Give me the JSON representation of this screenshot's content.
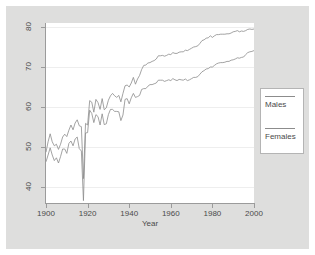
{
  "chart_data": {
    "type": "line",
    "title": "",
    "xlabel": "Year",
    "ylabel": "",
    "xlim": [
      1900,
      2000
    ],
    "ylim": [
      36,
      81
    ],
    "grid": true,
    "grid_orientation": "horizontal",
    "legend_position": "right-outside",
    "x_ticks": [
      1900,
      1920,
      1940,
      1960,
      1980,
      2000
    ],
    "y_ticks": [
      40,
      50,
      60,
      70,
      80
    ],
    "x_tick_labels": [
      "1900",
      "1920",
      "1940",
      "1960",
      "1980",
      "2000"
    ],
    "y_tick_labels": [
      "40",
      "50",
      "60",
      "70",
      "80"
    ],
    "annotations": [],
    "x": [
      1900,
      1901,
      1902,
      1903,
      1904,
      1905,
      1906,
      1907,
      1908,
      1909,
      1910,
      1911,
      1912,
      1913,
      1914,
      1915,
      1916,
      1917,
      1918,
      1919,
      1920,
      1921,
      1922,
      1923,
      1924,
      1925,
      1926,
      1927,
      1928,
      1929,
      1930,
      1931,
      1932,
      1933,
      1934,
      1935,
      1936,
      1937,
      1938,
      1939,
      1940,
      1941,
      1942,
      1943,
      1944,
      1945,
      1946,
      1947,
      1948,
      1949,
      1950,
      1951,
      1952,
      1953,
      1954,
      1955,
      1956,
      1957,
      1958,
      1959,
      1960,
      1961,
      1962,
      1963,
      1964,
      1965,
      1966,
      1967,
      1968,
      1969,
      1970,
      1971,
      1972,
      1973,
      1974,
      1975,
      1976,
      1977,
      1978,
      1979,
      1980,
      1981,
      1982,
      1983,
      1984,
      1985,
      1986,
      1987,
      1988,
      1989,
      1990,
      1991,
      1992,
      1993,
      1994,
      1995,
      1996,
      1997,
      1998,
      1999,
      2000
    ],
    "series": [
      {
        "name": "Females",
        "values": [
          48.7,
          51.3,
          53.3,
          51.3,
          50.3,
          50.7,
          49.4,
          50.7,
          52.5,
          53.2,
          52.6,
          54.2,
          55.5,
          54.3,
          56.0,
          56.8,
          55.3,
          55.1,
          42.1,
          55.9,
          55.5,
          61.6,
          61.2,
          58.7,
          61.9,
          61.1,
          59.4,
          62.1,
          59.3,
          59.8,
          61.7,
          62.8,
          63.4,
          62.8,
          62.4,
          62.9,
          61.3,
          63.4,
          65.3,
          65.5,
          65.0,
          66.0,
          67.4,
          65.7,
          67.0,
          67.9,
          69.4,
          70.4,
          70.5,
          71.0,
          71.1,
          71.4,
          71.6,
          72.0,
          72.8,
          72.8,
          72.9,
          72.7,
          72.9,
          73.2,
          73.1,
          73.6,
          73.4,
          73.4,
          73.7,
          73.8,
          73.8,
          74.2,
          74.1,
          74.4,
          74.7,
          75.0,
          75.1,
          75.3,
          75.9,
          76.6,
          76.8,
          77.2,
          77.3,
          77.8,
          77.4,
          77.8,
          78.1,
          78.1,
          78.2,
          78.2,
          78.2,
          78.3,
          78.3,
          78.5,
          78.8,
          78.9,
          79.1,
          78.8,
          79.0,
          78.9,
          79.1,
          79.4,
          79.5,
          79.4,
          79.5
        ]
      },
      {
        "name": "Males",
        "values": [
          46.3,
          48.0,
          49.8,
          48.0,
          46.6,
          47.3,
          46.0,
          47.6,
          49.5,
          49.5,
          48.4,
          50.9,
          51.5,
          50.3,
          52.0,
          52.5,
          49.6,
          49.0,
          36.6,
          53.5,
          53.6,
          59.2,
          58.4,
          56.1,
          58.1,
          57.6,
          55.5,
          58.3,
          55.6,
          55.8,
          58.1,
          59.4,
          59.4,
          58.9,
          58.9,
          58.8,
          56.6,
          58.0,
          61.9,
          62.1,
          60.8,
          62.3,
          63.4,
          62.4,
          62.6,
          62.9,
          64.4,
          64.6,
          64.6,
          65.2,
          65.6,
          65.6,
          65.8,
          66.0,
          66.7,
          66.7,
          66.7,
          66.4,
          66.6,
          66.8,
          66.6,
          67.1,
          66.8,
          66.6,
          66.9,
          66.8,
          66.7,
          67.0,
          66.6,
          66.8,
          67.1,
          67.4,
          67.4,
          67.6,
          68.2,
          68.8,
          69.1,
          69.5,
          69.6,
          70.0,
          70.0,
          70.4,
          70.8,
          71.0,
          71.1,
          71.1,
          71.2,
          71.4,
          71.4,
          71.7,
          71.8,
          72.0,
          72.3,
          72.2,
          72.4,
          72.5,
          73.1,
          73.6,
          73.8,
          73.9,
          74.1
        ]
      }
    ]
  },
  "axes": {
    "x_title": "Year"
  },
  "legend": {
    "entries": [
      {
        "label": "Males"
      },
      {
        "label": "Females"
      }
    ]
  },
  "colors": {
    "line": "#8c8c8c",
    "grid": "#eeeeee",
    "axis": "#9b9b9b",
    "outer_background": "#dededd",
    "plot_background": "#ffffff",
    "text": "#4a4a4a"
  }
}
